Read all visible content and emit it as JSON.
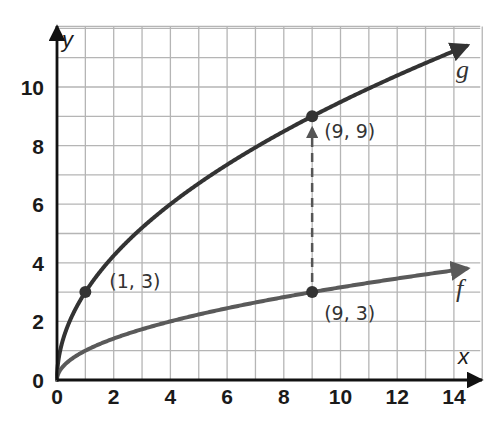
{
  "chart_data": {
    "type": "line",
    "title": "",
    "xlabel": "x",
    "ylabel": "y",
    "xlim": [
      0,
      15
    ],
    "ylim": [
      0,
      12
    ],
    "grid": true,
    "x_ticks": [
      0,
      2,
      4,
      6,
      8,
      10,
      12,
      14
    ],
    "y_ticks": [
      0,
      2,
      4,
      6,
      8,
      10
    ],
    "x_tick_labels": [
      "0",
      "2",
      "4",
      "6",
      "8",
      "10",
      "12",
      "14"
    ],
    "y_tick_labels": [
      "0",
      "2",
      "4",
      "6",
      "8",
      "10"
    ],
    "series": [
      {
        "name": "g",
        "equation": "g(x) = 3*sqrt(x)",
        "color": "#333333",
        "x": [
          0,
          1,
          2,
          4,
          6,
          8,
          9,
          10,
          12,
          14,
          15
        ],
        "values": [
          0,
          3,
          4.24,
          6,
          7.35,
          8.49,
          9,
          9.49,
          10.39,
          11.22,
          11.62
        ]
      },
      {
        "name": "f",
        "equation": "f(x) = sqrt(x)",
        "color": "#5a5a5a",
        "x": [
          0,
          1,
          2,
          4,
          6,
          8,
          9,
          10,
          12,
          14,
          15
        ],
        "values": [
          0,
          1,
          1.41,
          2,
          2.45,
          2.83,
          3,
          3.16,
          3.46,
          3.74,
          3.87
        ]
      }
    ],
    "points": [
      {
        "label": "(1, 3)",
        "x": 1,
        "y": 3,
        "series": "g"
      },
      {
        "label": "(9, 9)",
        "x": 9,
        "y": 9,
        "series": "g"
      },
      {
        "label": "(9, 3)",
        "x": 9,
        "y": 3,
        "series": "f"
      }
    ],
    "annotations": [
      {
        "type": "dashed-arrow",
        "from": [
          9,
          3
        ],
        "to": [
          9,
          9
        ],
        "description": "vertical stretch by factor 3"
      }
    ],
    "legend": "inline labels at curve ends: g (upper), f (lower)"
  }
}
